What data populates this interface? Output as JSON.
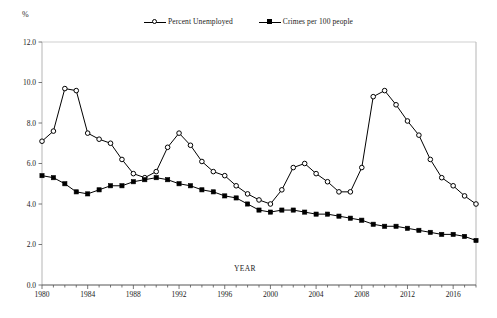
{
  "chart_data": {
    "type": "line",
    "title": "",
    "xlabel": "YEAR",
    "ylabel": "%",
    "ylim": [
      0.0,
      12.0
    ],
    "xlim": [
      1980,
      2018
    ],
    "grid": false,
    "legend_position": "top-center",
    "ytick_labels": [
      "12.0",
      "10.0",
      "8.0",
      "6.0",
      "4.0",
      "2.0",
      "0.0"
    ],
    "ytick_values": [
      12.0,
      10.0,
      8.0,
      6.0,
      4.0,
      2.0,
      0.0
    ],
    "xtick_labels": [
      "1980",
      "1984",
      "1988",
      "1992",
      "1996",
      "2000",
      "2004",
      "2008",
      "2012",
      "2016"
    ],
    "xtick_values": [
      1980,
      1984,
      1988,
      1992,
      1996,
      2000,
      2004,
      2008,
      2012,
      2016
    ],
    "x": [
      1980,
      1981,
      1982,
      1983,
      1984,
      1985,
      1986,
      1987,
      1988,
      1989,
      1990,
      1991,
      1992,
      1993,
      1994,
      1995,
      1996,
      1997,
      1998,
      1999,
      2000,
      2001,
      2002,
      2003,
      2004,
      2005,
      2006,
      2007,
      2008,
      2009,
      2010,
      2011,
      2012,
      2013,
      2014,
      2015,
      2016,
      2017,
      2018
    ],
    "series": [
      {
        "name": "Percent Unemployed",
        "marker": "open-circle",
        "color": "#000000",
        "values": [
          7.1,
          7.6,
          9.7,
          9.6,
          7.5,
          7.2,
          7.0,
          6.2,
          5.5,
          5.3,
          5.6,
          6.8,
          7.5,
          6.9,
          6.1,
          5.6,
          5.4,
          4.9,
          4.5,
          4.2,
          4.0,
          4.7,
          5.8,
          6.0,
          5.5,
          5.1,
          4.6,
          4.6,
          5.8,
          9.3,
          9.6,
          8.9,
          8.1,
          7.4,
          6.2,
          5.3,
          4.9,
          4.4,
          4.0
        ]
      },
      {
        "name": "Crimes per 100 people",
        "marker": "filled-square",
        "color": "#000000",
        "values": [
          5.4,
          5.3,
          5.0,
          4.6,
          4.5,
          4.7,
          4.9,
          4.9,
          5.1,
          5.2,
          5.3,
          5.2,
          5.0,
          4.9,
          4.7,
          4.6,
          4.4,
          4.3,
          4.0,
          3.7,
          3.6,
          3.7,
          3.7,
          3.6,
          3.5,
          3.5,
          3.4,
          3.3,
          3.2,
          3.0,
          2.9,
          2.9,
          2.8,
          2.7,
          2.6,
          2.5,
          2.5,
          2.4,
          2.2
        ]
      }
    ]
  },
  "axis": {
    "unit_symbol": "%",
    "x_title": "YEAR"
  }
}
